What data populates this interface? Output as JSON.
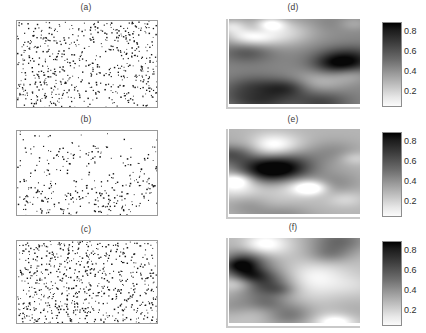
{
  "figure": {
    "background": "#ffffff",
    "width": 426,
    "height": 333,
    "layout": "3 rows x 2 columns, left = point patterns, right = intensity rasters with colorbars"
  },
  "panels": [
    {
      "id": "a",
      "label": "(a)",
      "type": "point-pattern",
      "n_points": 620,
      "seed": 11,
      "description": "dense random point pattern, heavier at left and right edges"
    },
    {
      "id": "b",
      "label": "(b)",
      "type": "point-pattern",
      "n_points": 330,
      "seed": 27,
      "description": "clustered point pattern, sparse upper left, dense lower half"
    },
    {
      "id": "c",
      "label": "(c)",
      "type": "point-pattern",
      "n_points": 700,
      "seed": 43,
      "description": "very dense near-uniform point pattern"
    },
    {
      "id": "d",
      "label": "(d)",
      "type": "raster",
      "seed": 5,
      "smooth": 7,
      "contrast": 1.15,
      "description": "smoothed intensity surface, dark patch upper left"
    },
    {
      "id": "e",
      "label": "(e)",
      "type": "raster",
      "seed": 18,
      "smooth": 7,
      "contrast": 1.35,
      "description": "smoothed intensity surface, light upper band, dark blobs centre"
    },
    {
      "id": "f",
      "label": "(f)",
      "type": "raster",
      "seed": 31,
      "smooth": 6,
      "contrast": 1.2,
      "description": "smoothed intensity surface, mottled dark blobs throughout"
    }
  ],
  "colorbars": [
    {
      "for_panel": "d",
      "ticks": [
        "0.8",
        "0.6",
        "0.4",
        "0.2"
      ],
      "vmin": 0.1,
      "vmax": 0.9,
      "orientation": "vertical",
      "scale": "grayscale-inverted (dark = high)"
    },
    {
      "for_panel": "e",
      "ticks": [
        "0.8",
        "0.6",
        "0.4",
        "0.2"
      ],
      "vmin": 0.1,
      "vmax": 0.9,
      "orientation": "vertical",
      "scale": "grayscale-inverted (dark = high)"
    },
    {
      "for_panel": "f",
      "ticks": [
        "0.8",
        "0.6",
        "0.4",
        "0.2"
      ],
      "vmin": 0.1,
      "vmax": 0.9,
      "orientation": "vertical",
      "scale": "grayscale-inverted (dark = high)"
    }
  ],
  "chart_data": {
    "type": "scatter",
    "title": "",
    "xlabel": "",
    "ylabel": "",
    "grid": false,
    "legend": null,
    "subplots": [
      {
        "id": "a",
        "title": "(a)",
        "type": "scatter",
        "n_points": 620,
        "xlim": [
          0,
          1
        ],
        "ylim": [
          0,
          1
        ]
      },
      {
        "id": "b",
        "title": "(b)",
        "type": "scatter",
        "n_points": 330,
        "xlim": [
          0,
          1
        ],
        "ylim": [
          0,
          1
        ]
      },
      {
        "id": "c",
        "title": "(c)",
        "type": "scatter",
        "n_points": 700,
        "xlim": [
          0,
          1
        ],
        "ylim": [
          0,
          1
        ]
      },
      {
        "id": "d",
        "title": "(d)",
        "type": "heatmap",
        "colorbar_ticks": [
          0.2,
          0.4,
          0.6,
          0.8
        ],
        "zlim": [
          0.1,
          0.9
        ],
        "cmap": "gray_r"
      },
      {
        "id": "e",
        "title": "(e)",
        "type": "heatmap",
        "colorbar_ticks": [
          0.2,
          0.4,
          0.6,
          0.8
        ],
        "zlim": [
          0.1,
          0.9
        ],
        "cmap": "gray_r"
      },
      {
        "id": "f",
        "title": "(f)",
        "type": "heatmap",
        "colorbar_ticks": [
          0.2,
          0.4,
          0.6,
          0.8
        ],
        "zlim": [
          0.1,
          0.9
        ],
        "cmap": "gray_r"
      }
    ]
  }
}
